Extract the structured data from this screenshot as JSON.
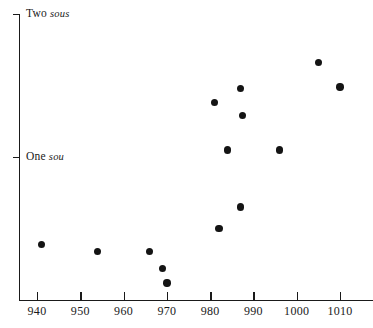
{
  "chart_data": {
    "type": "scatter",
    "title": "",
    "subtitle": "",
    "xlabel": "",
    "ylabel": "",
    "xlim": [
      934,
      1015
    ],
    "ylim": [
      -0.04,
      2.0
    ],
    "grid": false,
    "legend": null,
    "marker_color": "#141414",
    "axis_color": "#1a1a1a",
    "background_color": "#ffffff",
    "x_ticks": [
      {
        "value": 940,
        "label": "940"
      },
      {
        "value": 950,
        "label": "950"
      },
      {
        "value": 960,
        "label": "960"
      },
      {
        "value": 970,
        "label": "970"
      },
      {
        "value": 980,
        "label": "980"
      },
      {
        "value": 990,
        "label": "990"
      },
      {
        "value": 1000,
        "label": "1000"
      },
      {
        "value": 1010,
        "label": "1010"
      }
    ],
    "y_ticks": [
      {
        "value": 2.0,
        "label": "Two ",
        "unit": "sous"
      },
      {
        "value": 1.0,
        "label": "One ",
        "unit": "sou"
      }
    ],
    "points": [
      {
        "x": 941,
        "y": 0.39
      },
      {
        "x": 954,
        "y": 0.34
      },
      {
        "x": 966,
        "y": 0.34
      },
      {
        "x": 969,
        "y": 0.22
      },
      {
        "x": 970,
        "y": 0.12
      },
      {
        "x": 981,
        "y": 1.38
      },
      {
        "x": 982,
        "y": 0.5
      },
      {
        "x": 984,
        "y": 1.05
      },
      {
        "x": 987,
        "y": 1.48
      },
      {
        "x": 987.5,
        "y": 1.29
      },
      {
        "x": 987,
        "y": 0.65
      },
      {
        "x": 996,
        "y": 1.05
      },
      {
        "x": 1005,
        "y": 1.66
      },
      {
        "x": 1010,
        "y": 1.49
      }
    ]
  }
}
